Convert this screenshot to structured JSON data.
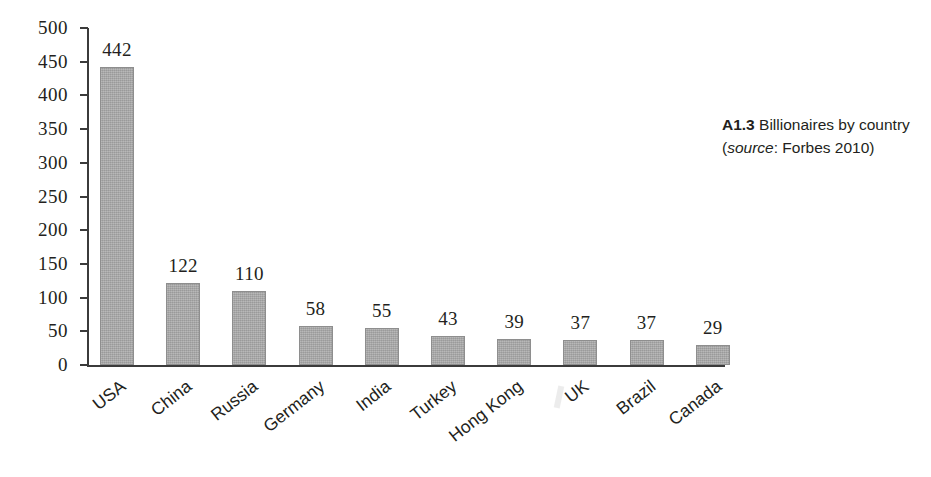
{
  "caption": {
    "number": "A1.3",
    "text_before_source": " Billionaires by country (",
    "source_word": "source",
    "text_after_source": ": Forbes 2010)"
  },
  "chart_data": {
    "type": "bar",
    "title": "",
    "subtitle": "",
    "xlabel": "",
    "ylabel": "",
    "ylim": [
      0,
      500
    ],
    "ytick_step": 50,
    "grid": false,
    "legend": null,
    "bar_color": "#a9a9a9",
    "axis_color": "#3b3b3b",
    "categories": [
      "USA",
      "China",
      "Russia",
      "Germany",
      "India",
      "Turkey",
      "Hong Kong",
      "UK",
      "Brazil",
      "Canada"
    ],
    "values": [
      442,
      122,
      110,
      58,
      55,
      43,
      39,
      37,
      37,
      29
    ],
    "value_labels": [
      "442",
      "122",
      "110",
      "58",
      "55",
      "43",
      "39",
      "37",
      "37",
      "29"
    ],
    "ytick_labels": [
      "0",
      "50",
      "100",
      "150",
      "200",
      "250",
      "300",
      "350",
      "400",
      "450",
      "500"
    ],
    "ytick_values": [
      0,
      50,
      100,
      150,
      200,
      250,
      300,
      350,
      400,
      450,
      500
    ],
    "annotation": "A1.3 Billionaires by country (source: Forbes 2010)"
  }
}
